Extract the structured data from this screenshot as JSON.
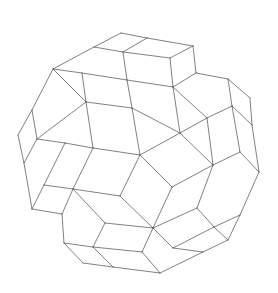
{
  "figure": {
    "title": "",
    "stroke_color": "#4a4a4a",
    "background": "#ffffff"
  },
  "vertices": {
    "A": [
      121,
      33
    ],
    "B": [
      147,
      38
    ],
    "C": [
      193,
      46
    ],
    "D": [
      94,
      47
    ],
    "E": [
      123,
      52
    ],
    "F": [
      170,
      58
    ],
    "G": [
      53,
      69
    ],
    "H": [
      82,
      73
    ],
    "I": [
      127,
      80
    ],
    "J": [
      173,
      87
    ],
    "K": [
      196,
      73
    ],
    "L": [
      228,
      79
    ],
    "M": [
      250,
      98
    ],
    "N": [
      232,
      106
    ],
    "O": [
      252,
      125
    ],
    "P": [
      207,
      118
    ],
    "Q": [
      86,
      102
    ],
    "R": [
      132,
      108
    ],
    "S": [
      32,
      110
    ],
    "T": [
      18,
      135
    ],
    "U": [
      37,
      139
    ],
    "V": [
      65,
      143
    ],
    "W": [
      93,
      148
    ],
    "X": [
      140,
      155
    ],
    "Y": [
      180,
      133
    ],
    "Z": [
      24,
      163
    ],
    "a": [
      44,
      185
    ],
    "b": [
      73,
      189
    ],
    "c": [
      120,
      196
    ],
    "d": [
      172,
      187
    ],
    "e": [
      213,
      165
    ],
    "f": [
      240,
      152
    ],
    "g": [
      259,
      172
    ],
    "h": [
      32,
      209
    ],
    "i": [
      62,
      214
    ],
    "j": [
      105,
      223
    ],
    "k": [
      153,
      228
    ],
    "l": [
      197,
      208
    ],
    "m": [
      214,
      227
    ],
    "n": [
      240,
      215
    ],
    "o": [
      64,
      243
    ],
    "p": [
      93,
      247
    ],
    "q": [
      142,
      252
    ],
    "r": [
      173,
      248
    ],
    "s": [
      203,
      252
    ],
    "t": [
      228,
      240
    ],
    "u": [
      83,
      263
    ],
    "v": [
      113,
      267
    ],
    "w": [
      160,
      273
    ]
  },
  "edges": [
    [
      "A",
      "B"
    ],
    [
      "B",
      "C"
    ],
    [
      "A",
      "D"
    ],
    [
      "B",
      "E"
    ],
    [
      "C",
      "F"
    ],
    [
      "D",
      "E"
    ],
    [
      "E",
      "F"
    ],
    [
      "D",
      "G"
    ],
    [
      "E",
      "I"
    ],
    [
      "F",
      "J"
    ],
    [
      "C",
      "K"
    ],
    [
      "G",
      "H"
    ],
    [
      "H",
      "I"
    ],
    [
      "I",
      "J"
    ],
    [
      "J",
      "K"
    ],
    [
      "K",
      "L"
    ],
    [
      "L",
      "M"
    ],
    [
      "L",
      "N"
    ],
    [
      "M",
      "O"
    ],
    [
      "N",
      "O"
    ],
    [
      "N",
      "P"
    ],
    [
      "J",
      "P"
    ],
    [
      "G",
      "Q"
    ],
    [
      "H",
      "Q"
    ],
    [
      "Q",
      "R"
    ],
    [
      "I",
      "R"
    ],
    [
      "R",
      "Y"
    ],
    [
      "J",
      "Y"
    ],
    [
      "P",
      "Y"
    ],
    [
      "G",
      "S"
    ],
    [
      "S",
      "T"
    ],
    [
      "S",
      "U"
    ],
    [
      "Q",
      "U"
    ],
    [
      "U",
      "V"
    ],
    [
      "Q",
      "W"
    ],
    [
      "V",
      "W"
    ],
    [
      "W",
      "X"
    ],
    [
      "X",
      "R"
    ],
    [
      "X",
      "Y"
    ],
    [
      "Y",
      "e"
    ],
    [
      "P",
      "e"
    ],
    [
      "e",
      "f"
    ],
    [
      "N",
      "f"
    ],
    [
      "f",
      "g"
    ],
    [
      "O",
      "g"
    ],
    [
      "T",
      "Z"
    ],
    [
      "U",
      "Z"
    ],
    [
      "Z",
      "h"
    ],
    [
      "V",
      "a"
    ],
    [
      "a",
      "b"
    ],
    [
      "W",
      "b"
    ],
    [
      "a",
      "h"
    ],
    [
      "h",
      "i"
    ],
    [
      "b",
      "i"
    ],
    [
      "b",
      "c"
    ],
    [
      "X",
      "c"
    ],
    [
      "c",
      "k"
    ],
    [
      "X",
      "d"
    ],
    [
      "d",
      "e"
    ],
    [
      "d",
      "k"
    ],
    [
      "e",
      "l"
    ],
    [
      "l",
      "m"
    ],
    [
      "g",
      "n"
    ],
    [
      "m",
      "n"
    ],
    [
      "n",
      "t"
    ],
    [
      "m",
      "t"
    ],
    [
      "l",
      "k"
    ],
    [
      "b",
      "j"
    ],
    [
      "j",
      "k"
    ],
    [
      "i",
      "o"
    ],
    [
      "o",
      "p"
    ],
    [
      "j",
      "p"
    ],
    [
      "p",
      "q"
    ],
    [
      "k",
      "q"
    ],
    [
      "k",
      "r"
    ],
    [
      "m",
      "r"
    ],
    [
      "r",
      "s"
    ],
    [
      "t",
      "s"
    ],
    [
      "q",
      "w"
    ],
    [
      "s",
      "w"
    ],
    [
      "o",
      "u"
    ],
    [
      "u",
      "v"
    ],
    [
      "p",
      "v"
    ],
    [
      "v",
      "w"
    ]
  ]
}
